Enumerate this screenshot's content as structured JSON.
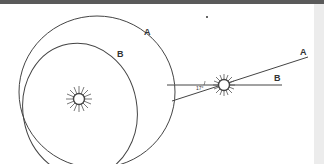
{
  "diagram": {
    "left": {
      "orbit_a_label": "A",
      "orbit_b_label": "B",
      "center_icon": "sun-icon"
    },
    "right": {
      "line_a_label": "A",
      "line_b_label": "B",
      "angle_label": "17°",
      "center_icon": "sun-icon"
    },
    "colors": {
      "line": "#444444",
      "background": "#ffffff",
      "topbar": "#5a5a5a"
    }
  }
}
